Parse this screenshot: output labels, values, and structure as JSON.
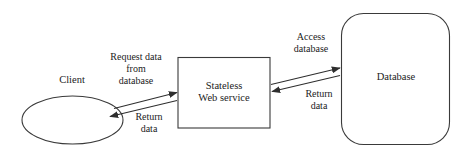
{
  "diagram": {
    "stroke_color": "#3a3a3a",
    "text_color": "#222222",
    "background_color": "#ffffff",
    "nodes": [
      {
        "id": "client",
        "shape": "ellipse",
        "label": "Client"
      },
      {
        "id": "service",
        "shape": "rectangle",
        "label": "Stateless\nWeb service"
      },
      {
        "id": "database",
        "shape": "rounded-rectangle",
        "label": "Database"
      }
    ],
    "edges": [
      {
        "id": "request-data",
        "from": "client",
        "to": "service",
        "label": "Request data\nfrom\ndatabase"
      },
      {
        "id": "return-client",
        "from": "service",
        "to": "client",
        "label": "Return\ndata"
      },
      {
        "id": "access-db",
        "from": "service",
        "to": "database",
        "label": "Access\ndatabase"
      },
      {
        "id": "return-db",
        "from": "database",
        "to": "service",
        "label": "Return\ndata"
      }
    ]
  }
}
